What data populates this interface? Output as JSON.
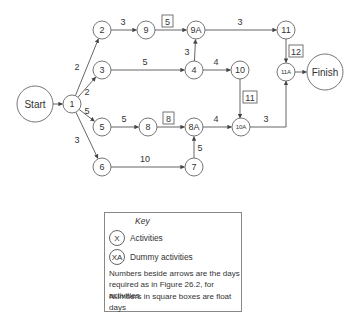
{
  "diagram": {
    "nodes": [
      {
        "id": "start",
        "label": "Start",
        "x": 35,
        "y": 104,
        "r": 18,
        "fs": 10
      },
      {
        "id": "1",
        "label": "1",
        "x": 72,
        "y": 104,
        "r": 9,
        "fs": 9
      },
      {
        "id": "2",
        "label": "2",
        "x": 102,
        "y": 30,
        "r": 9,
        "fs": 9
      },
      {
        "id": "9",
        "label": "9",
        "x": 146,
        "y": 30,
        "r": 9,
        "fs": 9
      },
      {
        "id": "9A",
        "label": "9A",
        "x": 196,
        "y": 30,
        "r": 9,
        "fs": 9
      },
      {
        "id": "11",
        "label": "11",
        "x": 286,
        "y": 30,
        "r": 9,
        "fs": 9
      },
      {
        "id": "3",
        "label": "3",
        "x": 102,
        "y": 70,
        "r": 9,
        "fs": 9
      },
      {
        "id": "4",
        "label": "4",
        "x": 194,
        "y": 70,
        "r": 9,
        "fs": 9
      },
      {
        "id": "10",
        "label": "10",
        "x": 240,
        "y": 70,
        "r": 9,
        "fs": 9
      },
      {
        "id": "11A",
        "label": "11A",
        "x": 286,
        "y": 72,
        "r": 9,
        "fs": 6
      },
      {
        "id": "finish",
        "label": "Finish",
        "x": 325,
        "y": 72,
        "r": 18,
        "fs": 10
      },
      {
        "id": "5",
        "label": "5",
        "x": 102,
        "y": 127,
        "r": 9,
        "fs": 9
      },
      {
        "id": "8",
        "label": "8",
        "x": 148,
        "y": 127,
        "r": 9,
        "fs": 9
      },
      {
        "id": "8A",
        "label": "8A",
        "x": 194,
        "y": 127,
        "r": 9,
        "fs": 9
      },
      {
        "id": "10A",
        "label": "10A",
        "x": 241,
        "y": 127,
        "r": 9,
        "fs": 6
      },
      {
        "id": "6",
        "label": "6",
        "x": 102,
        "y": 167,
        "r": 9,
        "fs": 9
      },
      {
        "id": "7",
        "label": "7",
        "x": 194,
        "y": 167,
        "r": 9,
        "fs": 9
      }
    ],
    "edges": [
      {
        "from": "start",
        "to": "1",
        "label": "",
        "lx": 0,
        "ly": 0
      },
      {
        "from": "1",
        "to": "2",
        "label": "2",
        "lx": 77,
        "ly": 70
      },
      {
        "from": "1",
        "to": "3",
        "label": "2",
        "lx": 87,
        "ly": 95
      },
      {
        "from": "1",
        "to": "5",
        "label": "5",
        "lx": 87,
        "ly": 114
      },
      {
        "from": "1",
        "to": "6",
        "label": "3",
        "lx": 77,
        "ly": 143
      },
      {
        "from": "2",
        "to": "9",
        "label": "3",
        "lx": 123,
        "ly": 25
      },
      {
        "from": "9",
        "to": "9A",
        "label": "",
        "lx": 0,
        "ly": 0
      },
      {
        "from": "9A",
        "to": "11",
        "label": "3",
        "lx": 240,
        "ly": 25
      },
      {
        "from": "3",
        "to": "4",
        "label": "5",
        "lx": 145,
        "ly": 65
      },
      {
        "from": "4",
        "to": "9A",
        "label": "3",
        "lx": 187,
        "ly": 55
      },
      {
        "from": "4",
        "to": "10",
        "label": "4",
        "lx": 216,
        "ly": 65
      },
      {
        "from": "11",
        "to": "11A",
        "label": "",
        "lx": 0,
        "ly": 0
      },
      {
        "from": "11A",
        "to": "finish",
        "label": "",
        "lx": 0,
        "ly": 0
      },
      {
        "from": "5",
        "to": "8",
        "label": "5",
        "lx": 124,
        "ly": 122
      },
      {
        "from": "8",
        "to": "8A",
        "label": "",
        "lx": 0,
        "ly": 0
      },
      {
        "from": "8A",
        "to": "10A",
        "label": "4",
        "lx": 216,
        "ly": 122
      },
      {
        "from": "7",
        "to": "8A",
        "label": "5",
        "lx": 200,
        "ly": 151
      },
      {
        "from": "6",
        "to": "7",
        "label": "10",
        "lx": 145,
        "ly": 162
      }
    ],
    "special_edges": [
      {
        "id": "10-10A",
        "label": "",
        "path": "M240,79 L240,118"
      },
      {
        "id": "10A-11A",
        "label": "3",
        "path": "M250,127 L286,127 L286,81",
        "lx": 266,
        "ly": 122
      }
    ],
    "float_boxes": [
      {
        "value": "5",
        "x": 162,
        "y": 15
      },
      {
        "value": "8",
        "x": 163,
        "y": 112
      },
      {
        "value": "11",
        "x": 243,
        "y": 91
      },
      {
        "value": "12",
        "x": 289,
        "y": 45
      }
    ]
  },
  "key": {
    "title": "Key",
    "activity_symbol": "X",
    "activity_label": "Activities",
    "dummy_symbol": "XA",
    "dummy_label": "Dummy activities",
    "note1": "Numbers beside arrows are the days required as in Figure 26.2, for activities",
    "note2": "Numbers in square boxes are float days"
  }
}
